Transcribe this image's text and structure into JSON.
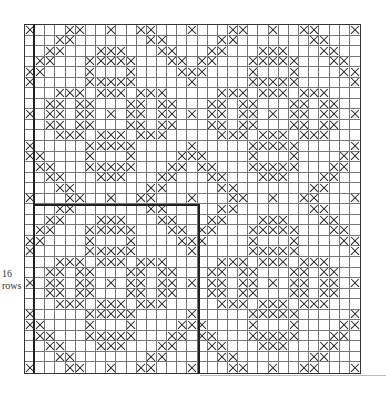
{
  "diagram": {
    "type": "cross-stitch chart",
    "rows": 33,
    "cols": 33,
    "repeat": 16,
    "label": {
      "line1": "16",
      "line2": "rows"
    },
    "repeat_box": {
      "col_start": 1,
      "col_end": 17,
      "row_start": 17,
      "row_end": 33
    },
    "motif_rows": [
      [
        0,
        4,
        5,
        8,
        11,
        12,
        16
      ],
      [
        3,
        4,
        12,
        13
      ],
      [
        2,
        3,
        7,
        8,
        9,
        13,
        14
      ],
      [
        1,
        2,
        6,
        7,
        8,
        9,
        10,
        14,
        15
      ],
      [
        0,
        1,
        6,
        10,
        15,
        16
      ],
      [
        0,
        6,
        7,
        8,
        9,
        10,
        16
      ],
      [
        3,
        4,
        5,
        7,
        8,
        9,
        11,
        12,
        13
      ],
      [
        2,
        3,
        5,
        6,
        10,
        11,
        13,
        14
      ],
      [
        0,
        2,
        3,
        5,
        6,
        8,
        10,
        11,
        13,
        14,
        16
      ],
      [
        2,
        3,
        5,
        6,
        10,
        11,
        13,
        14
      ],
      [
        3,
        4,
        5,
        7,
        8,
        9,
        11,
        12,
        13
      ],
      [
        0,
        6,
        7,
        8,
        9,
        10,
        16
      ],
      [
        0,
        1,
        6,
        10,
        15,
        16
      ],
      [
        1,
        2,
        6,
        7,
        8,
        9,
        10,
        14,
        15
      ],
      [
        2,
        3,
        7,
        8,
        9,
        13,
        14
      ],
      [
        3,
        4,
        12,
        13
      ]
    ],
    "colors": {
      "grid": "#777777",
      "stitch": "#222222",
      "background": "#ffffff"
    }
  }
}
